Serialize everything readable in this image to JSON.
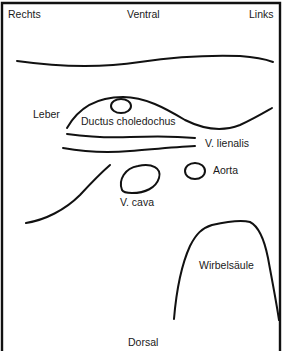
{
  "diagram": {
    "type": "anatomical-cross-section-sketch",
    "orientation": {
      "top": "Ventral",
      "bottom": "Dorsal",
      "left": "Rechts",
      "right": "Links"
    },
    "structures": {
      "liver": "Leber",
      "bile_duct": "Ductus choledochus",
      "splenic_vein": "V. lienalis",
      "aorta": "Aorta",
      "vena_cava": "V. cava",
      "spine": "Wirbelsäule"
    },
    "colors": {
      "stroke": "#111111",
      "background": "#ffffff",
      "text": "#1a1a1a"
    }
  }
}
